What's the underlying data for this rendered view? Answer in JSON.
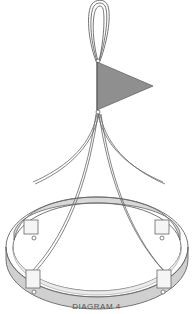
{
  "diagram": {
    "caption": "DIAGRAM 4",
    "parts": {
      "hanging_loop": "hanging-loop",
      "flag": "triangular-pennant-flag",
      "suspension_cords": 4,
      "ring": "circular-hoop-ring",
      "clips": 4
    },
    "colors": {
      "flag_fill": "#8f8f8f",
      "ring_band": "#d0d0d0",
      "ring_top": "#ececec",
      "clip_fill": "#f5f5f5",
      "stroke": "#555555",
      "caption_text": "#555555"
    }
  }
}
